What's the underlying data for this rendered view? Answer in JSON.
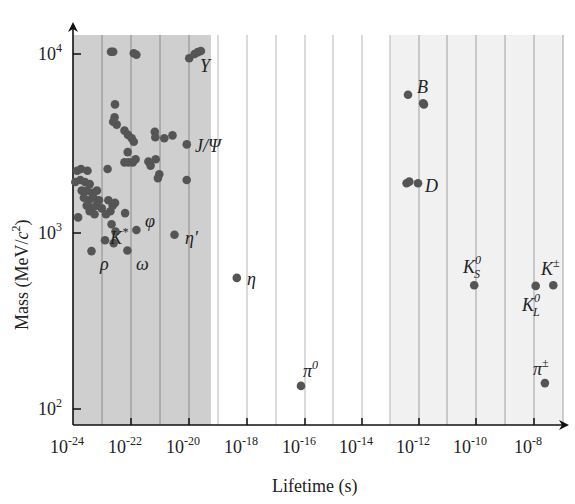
{
  "chart_data": {
    "type": "scatter",
    "title": "",
    "xlabel": "Lifetime (s)",
    "ylabel": "Mass (MeV/c²)",
    "xscale": "log",
    "yscale": "log",
    "xlim": [
      1e-24,
      1e-07
    ],
    "ylim": [
      81,
      12000
    ],
    "x_ticks": [
      {
        "exp": "-24",
        "value": 1e-24
      },
      {
        "exp": "-22",
        "value": 1e-22
      },
      {
        "exp": "-20",
        "value": 1e-20
      },
      {
        "exp": "-18",
        "value": 1e-18
      },
      {
        "exp": "-16",
        "value": 1e-16
      },
      {
        "exp": "-14",
        "value": 1e-14
      },
      {
        "exp": "-12",
        "value": 1e-12
      },
      {
        "exp": "-10",
        "value": 1e-10
      },
      {
        "exp": "-8",
        "value": 1e-08
      }
    ],
    "y_ticks": [
      {
        "exp": "4",
        "value": 10000
      },
      {
        "exp": "3",
        "value": 1000
      },
      {
        "exp": "2",
        "value": 100
      }
    ],
    "grid": "vertical lines at every decade",
    "shaded_regions": [
      {
        "name": "strong-decay region",
        "x_from": 1e-24,
        "x_to": 6e-20,
        "color": "#cfcfcf"
      },
      {
        "name": "weak-decay region",
        "x_from": 1e-13,
        "x_to": 1e-07,
        "color": "#f1f1f1"
      }
    ],
    "series": [
      {
        "name": "mesons",
        "color": "#555555",
        "points": [
          {
            "x": 2.1e-23,
            "y": 10300
          },
          {
            "x": 2.5e-23,
            "y": 10300
          },
          {
            "x": 1.3e-22,
            "y": 10100
          },
          {
            "x": 1.6e-22,
            "y": 9900
          },
          {
            "x": 1.1e-20,
            "y": 9460
          },
          {
            "x": 1.7e-20,
            "y": 10000
          },
          {
            "x": 2.2e-20,
            "y": 10250
          },
          {
            "x": 2.8e-20,
            "y": 10400
          },
          {
            "x": 2.9e-23,
            "y": 5200
          },
          {
            "x": 2.5e-23,
            "y": 4150
          },
          {
            "x": 3.3e-23,
            "y": 4000
          },
          {
            "x": 2.8e-23,
            "y": 4400
          },
          {
            "x": 6.2e-23,
            "y": 3700
          },
          {
            "x": 8.2e-23,
            "y": 3500
          },
          {
            "x": 1.1e-22,
            "y": 3350
          },
          {
            "x": 1.3e-22,
            "y": 3200
          },
          {
            "x": 7e-22,
            "y": 3650
          },
          {
            "x": 7.3e-22,
            "y": 3400
          },
          {
            "x": 1.5e-21,
            "y": 3350
          },
          {
            "x": 2.9e-21,
            "y": 3480
          },
          {
            "x": 9.1e-21,
            "y": 3097
          },
          {
            "x": 8e-23,
            "y": 2800
          },
          {
            "x": 6.2e-23,
            "y": 2450
          },
          {
            "x": 8.6e-23,
            "y": 2450
          },
          {
            "x": 1.2e-22,
            "y": 2450
          },
          {
            "x": 1.5e-22,
            "y": 2550
          },
          {
            "x": 4.2e-22,
            "y": 2480
          },
          {
            "x": 5e-22,
            "y": 2350
          },
          {
            "x": 7.5e-22,
            "y": 2550
          },
          {
            "x": 1e-21,
            "y": 2100
          },
          {
            "x": 9e-22,
            "y": 2000
          },
          {
            "x": 9e-21,
            "y": 1950
          },
          {
            "x": 1.4e-24,
            "y": 2200
          },
          {
            "x": 1.9e-24,
            "y": 2250
          },
          {
            "x": 3.2e-24,
            "y": 2200
          },
          {
            "x": 1.6e-23,
            "y": 2250
          },
          {
            "x": 1.2e-24,
            "y": 1900
          },
          {
            "x": 1.8e-24,
            "y": 1950
          },
          {
            "x": 2.6e-24,
            "y": 1900
          },
          {
            "x": 3.8e-24,
            "y": 1850
          },
          {
            "x": 2e-24,
            "y": 1700
          },
          {
            "x": 3e-24,
            "y": 1700
          },
          {
            "x": 4.6e-24,
            "y": 1650
          },
          {
            "x": 6.8e-24,
            "y": 1700
          },
          {
            "x": 2.4e-24,
            "y": 1550
          },
          {
            "x": 3.6e-24,
            "y": 1500
          },
          {
            "x": 5.2e-24,
            "y": 1550
          },
          {
            "x": 8e-24,
            "y": 1500
          },
          {
            "x": 3e-24,
            "y": 1400
          },
          {
            "x": 4.4e-24,
            "y": 1350
          },
          {
            "x": 6.4e-24,
            "y": 1400
          },
          {
            "x": 1e-23,
            "y": 1350
          },
          {
            "x": 2e-23,
            "y": 1300
          },
          {
            "x": 3.8e-24,
            "y": 1300
          },
          {
            "x": 5.6e-24,
            "y": 1250
          },
          {
            "x": 1.4e-23,
            "y": 1250
          },
          {
            "x": 2.4e-23,
            "y": 1400
          },
          {
            "x": 1.7e-23,
            "y": 1500
          },
          {
            "x": 2.9e-23,
            "y": 1450
          },
          {
            "x": 1.5e-24,
            "y": 1200
          },
          {
            "x": 6.5e-23,
            "y": 1270
          },
          {
            "x": 2.2e-23,
            "y": 1100
          },
          {
            "x": 3e-23,
            "y": 1000
          },
          {
            "x": 1.3e-23,
            "y": 892
          },
          {
            "x": 2.6e-23,
            "y": 860
          },
          {
            "x": 4.4e-24,
            "y": 775
          },
          {
            "x": 7.8e-23,
            "y": 782
          },
          {
            "x": 1.6e-22,
            "y": 1019
          },
          {
            "x": 3.4e-21,
            "y": 958
          },
          {
            "x": 5e-19,
            "y": 548
          },
          {
            "x": 8.5e-17,
            "y": 135
          },
          {
            "x": 4.5e-13,
            "y": 5900
          },
          {
            "x": 1.5e-12,
            "y": 5280
          },
          {
            "x": 1.6e-12,
            "y": 5200
          },
          {
            "x": 4e-13,
            "y": 1870
          },
          {
            "x": 5e-13,
            "y": 1910
          },
          {
            "x": 1e-12,
            "y": 1868
          },
          {
            "x": 9e-11,
            "y": 498
          },
          {
            "x": 5.1e-08,
            "y": 498
          },
          {
            "x": 1.24e-08,
            "y": 494
          },
          {
            "x": 2.6e-08,
            "y": 140
          }
        ]
      }
    ],
    "annotations": [
      {
        "label": "Υ",
        "x": 1.7e-20,
        "y": 9460
      },
      {
        "label": "J/Ψ",
        "x": 9.1e-21,
        "y": 3097
      },
      {
        "label": "φ",
        "x": 1.6e-22,
        "y": 1019
      },
      {
        "label": "K*",
        "x": 2.2e-23,
        "y": 892
      },
      {
        "label": "η′",
        "x": 3.4e-21,
        "y": 958
      },
      {
        "label": "ρ",
        "x": 4.4e-24,
        "y": 775
      },
      {
        "label": "ω",
        "x": 7.8e-23,
        "y": 782
      },
      {
        "label": "η",
        "x": 5e-19,
        "y": 548
      },
      {
        "label": "π⁰",
        "x": 8.5e-17,
        "y": 135
      },
      {
        "label": "B",
        "x": 1.5e-12,
        "y": 5280
      },
      {
        "label": "D",
        "x": 1e-12,
        "y": 1868
      },
      {
        "label": "K⁰_S",
        "x": 9e-11,
        "y": 498
      },
      {
        "label": "K⁰_L",
        "x": 5.1e-08,
        "y": 498
      },
      {
        "label": "K±",
        "x": 1.24e-08,
        "y": 494
      },
      {
        "label": "π±",
        "x": 2.6e-08,
        "y": 140
      }
    ]
  },
  "labels": {
    "x_axis_title": "Lifetime (s)",
    "y_axis_title_main": "Mass (MeV/",
    "y_axis_title_c": "c",
    "y_axis_title_sup": "2",
    "y_axis_title_end": ")",
    "tick_base": "10",
    "ann_upsilon": "Υ",
    "ann_jpsi": "J/Ψ",
    "ann_phi": "φ",
    "ann_kstar": "K",
    "ann_kstar_sup": "*",
    "ann_etaprime": "η′",
    "ann_rho": "ρ",
    "ann_omega": "ω",
    "ann_eta": "η",
    "ann_pi0": "π",
    "ann_pi0_sup": "0",
    "ann_B": "B",
    "ann_D": "D",
    "ann_KS": "K",
    "ann_KS_sup": "0",
    "ann_KS_sub": "S",
    "ann_KL": "K",
    "ann_KL_sup": "0",
    "ann_KL_sub": "L",
    "ann_Kpm": "K",
    "ann_Kpm_sup": "±",
    "ann_pipm": "π",
    "ann_pipm_sup": "±"
  }
}
